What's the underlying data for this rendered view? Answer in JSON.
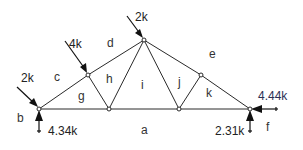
{
  "diagram": {
    "type": "truss-free-body-diagram",
    "joints": [
      {
        "id": "L",
        "x": 39,
        "y": 109
      },
      {
        "id": "U1",
        "x": 88,
        "y": 75
      },
      {
        "id": "B1",
        "x": 109,
        "y": 109
      },
      {
        "id": "T",
        "x": 144,
        "y": 40
      },
      {
        "id": "B2",
        "x": 179,
        "y": 109
      },
      {
        "id": "U2",
        "x": 201,
        "y": 75
      },
      {
        "id": "R",
        "x": 250,
        "y": 109
      }
    ],
    "members": [
      [
        "L",
        "U1"
      ],
      [
        "U1",
        "T"
      ],
      [
        "T",
        "U2"
      ],
      [
        "U2",
        "R"
      ],
      [
        "L",
        "B1"
      ],
      [
        "B1",
        "B2"
      ],
      [
        "B2",
        "R"
      ],
      [
        "U1",
        "B1"
      ],
      [
        "B1",
        "T"
      ],
      [
        "T",
        "B2"
      ],
      [
        "B2",
        "U2"
      ]
    ],
    "loads": [
      {
        "label": "2k",
        "at": "L",
        "direction": "down-right",
        "from": [
          17,
          87
        ],
        "to": [
          38,
          107
        ]
      },
      {
        "label": "4k",
        "at": "U1",
        "direction": "down-right",
        "from": [
          65,
          41
        ],
        "to": [
          87,
          73
        ]
      },
      {
        "label": "2k",
        "at": "T",
        "direction": "down-right",
        "from": [
          127,
          16
        ],
        "to": [
          143,
          38
        ]
      }
    ],
    "reactions": [
      {
        "label": "4.34k",
        "at": "L",
        "direction": "up"
      },
      {
        "label": "2.31k",
        "at": "R",
        "direction": "up"
      },
      {
        "label": "4.44k",
        "at": "R",
        "direction": "left"
      }
    ],
    "zones": [
      "a",
      "b",
      "c",
      "d",
      "e",
      "f",
      "g",
      "h",
      "i",
      "j",
      "k"
    ]
  },
  "labels": {
    "load_left": "2k",
    "load_mid": "4k",
    "load_top": "2k",
    "reaction_left_vertical": "4.34k",
    "reaction_right_vertical": "2.31k",
    "reaction_right_horizontal": "4.44k",
    "zone_a": "a",
    "zone_b": "b",
    "zone_c": "c",
    "zone_d": "d",
    "zone_e": "e",
    "zone_f": "f",
    "zone_g": "g",
    "zone_h": "h",
    "zone_i": "i",
    "zone_j": "j",
    "zone_k": "k"
  },
  "colors": {
    "line": "#2a2a2a",
    "arrow": "#111111",
    "text": "#222222",
    "reaction_h_text": "#2b2f55",
    "background": "#ffffff"
  }
}
